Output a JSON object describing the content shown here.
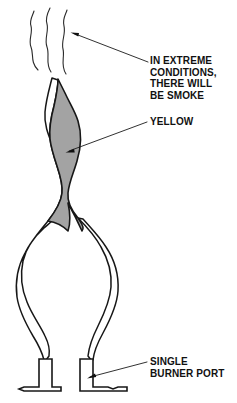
{
  "figure": {
    "background_color": "#ffffff",
    "stroke_color": "#1a1a1a",
    "flame_inner_fill": "#a3a3a3",
    "flame_outer_fill": "#ffffff"
  },
  "labels": {
    "smoke": {
      "name": "in-extreme-conditions-there-will-be-smoke",
      "lines": [
        "IN EXTREME",
        "CONDITIONS,",
        "THERE WILL",
        "BE SMOKE"
      ]
    },
    "yellow": {
      "name": "yellow",
      "lines": [
        "YELLOW"
      ]
    },
    "burner": {
      "name": "single-burner-port",
      "lines": [
        "SINGLE",
        "BURNER PORT"
      ]
    }
  },
  "parts": {
    "smoke_wisps": "smoke-wisps",
    "inner_cone": "inner-flame-cone-yellow",
    "outer_flame": "outer-flame-envelope",
    "burner_port_left": "burner-port-left",
    "burner_port_right": "burner-port-right"
  },
  "callouts": [
    {
      "target": "smoke-wisps",
      "from": [
        150,
        62
      ],
      "to": [
        72,
        33
      ]
    },
    {
      "target": "inner-flame-cone-yellow",
      "from": [
        146,
        122
      ],
      "to": [
        67,
        152
      ]
    },
    {
      "target": "burner-port-right",
      "from": [
        146,
        362
      ],
      "to": [
        88,
        378
      ]
    }
  ]
}
